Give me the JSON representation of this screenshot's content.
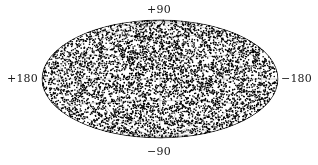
{
  "figure": {
    "title": "",
    "background_color": "#ffffff",
    "width": 318,
    "height": 165
  },
  "labels": {
    "north_pole": "+90",
    "south_pole": "−90",
    "left_meridian": "+180",
    "right_meridian": "−180",
    "text_color": "#1a1a1a"
  },
  "chart_data": {
    "type": "scatter",
    "projection": "hammer-aitoff",
    "title": "",
    "xlabel": "",
    "ylabel": "",
    "xlim": [
      180,
      -180
    ],
    "ylim": [
      -90,
      90
    ],
    "grid": true,
    "legend": null,
    "marker": {
      "shape": "circle",
      "color": "#000000",
      "size_px": 1.6
    },
    "point_count": 5200,
    "distribution": "isotropic-uniform-on-sphere",
    "tick_labels": {
      "longitude": [
        "+180",
        "-180"
      ],
      "latitude": [
        "+90",
        "-90"
      ]
    },
    "graticule": {
      "meridian_step_deg": 30,
      "parallel_step_deg": 30,
      "color": "#9a9a9a",
      "line_width": 0.5
    },
    "ellipse": {
      "center_x": 160,
      "center_y": 79,
      "semi_axis_x": 118,
      "semi_axis_y": 59
    }
  }
}
